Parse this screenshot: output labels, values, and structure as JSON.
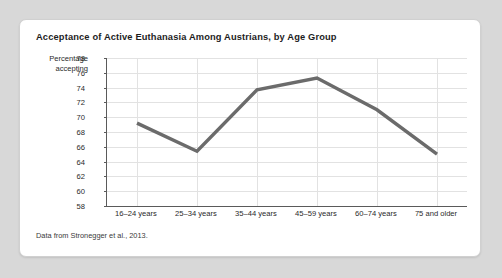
{
  "card": {
    "title": "Acceptance of Active Euthanasia Among Austrians, by Age Group",
    "source_note": "Data from Stronegger et al., 2013.",
    "axis_label_line1": "Percentage",
    "axis_label_line2": "accepting"
  },
  "chart_data": {
    "type": "line",
    "title": "Acceptance of Active Euthanasia Among Austrians, by Age Group",
    "subtitle": "",
    "xlabel": "",
    "ylabel": "Percentage accepting",
    "categories": [
      "16–24 years",
      "25–34 years",
      "35–44 years",
      "45–59 years",
      "60–74 years",
      "75 and older"
    ],
    "values": [
      69.2,
      65.4,
      73.7,
      75.3,
      71.0,
      65.0
    ],
    "series": [
      {
        "name": "Percentage accepting",
        "values": [
          69.2,
          65.4,
          73.7,
          75.3,
          71.0,
          65.0
        ]
      }
    ],
    "ylim": [
      58,
      78
    ],
    "yticks": [
      78,
      76,
      74,
      72,
      70,
      68,
      66,
      64,
      62,
      60,
      58
    ],
    "ytick_step": 2,
    "grid": true,
    "grid_x": true,
    "grid_y": true,
    "legend": false,
    "legend_position": "none",
    "markers": false,
    "line_color": "#6b6b6b",
    "line_width": 3.4,
    "annotations": [
      "Data from Stronegger et al., 2013."
    ]
  }
}
